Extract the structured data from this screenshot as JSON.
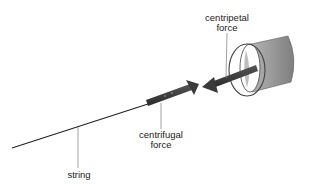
{
  "diagram": {
    "labels": {
      "centripetal": {
        "line1": "centripetal",
        "line2": "force"
      },
      "centrifugal": {
        "line1": "centrifugal",
        "line2": "force"
      },
      "string": {
        "text": "string"
      }
    },
    "colors": {
      "string": "#222222",
      "arrow_fill": "#3a3a3a",
      "bucket_fill": "#9a9a9a",
      "bucket_rim": "#555555",
      "leader_line": "#8a8a8a",
      "background": "#ffffff"
    }
  }
}
